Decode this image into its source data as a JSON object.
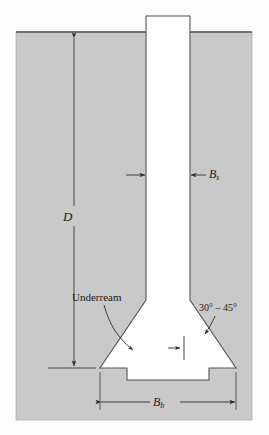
{
  "figure": {
    "colors": {
      "soil_fill": "#c9c9c9",
      "soil_edge": "#808080",
      "ground_line": "#6e6e6e",
      "concrete_fill": "#ffffff",
      "outline": "#555555",
      "dimension_line": "#3a3a3a",
      "text": "#1b1b1b",
      "page_background": "#fdfdfd"
    }
  },
  "labels": {
    "depth": "D",
    "shaft_diameter_base": "B",
    "shaft_diameter_sub": "s",
    "bell_diameter_base": "B",
    "bell_diameter_sub": "b",
    "underream": "Underream",
    "bell_angle": "30° – 45°"
  },
  "geometry": {
    "soil": {
      "left": 16,
      "right": 252,
      "top": 32,
      "bottom": 420
    },
    "ground_surface_y": 32,
    "shaft": {
      "left": 146,
      "right": 190,
      "top": 16,
      "taper_start_y": 300
    },
    "bell": {
      "left": 100,
      "right": 236,
      "base_y": 368
    },
    "toe": {
      "left": 127,
      "right": 209,
      "bottom_y": 380
    },
    "depth_dimension": {
      "x": 74,
      "top_y": 36,
      "bottom_y": 368
    },
    "bell_dimension": {
      "y": 402,
      "left_x": 100,
      "right_x": 236
    },
    "shaft_dimension_y": 175
  }
}
